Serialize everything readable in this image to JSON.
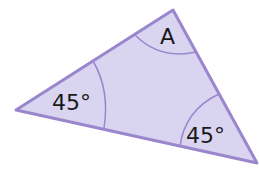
{
  "diagram": {
    "type": "triangle-angles",
    "fill_color": "#d9d4f0",
    "stroke_color": "#9a86cc",
    "vertices": {
      "top": [
        173,
        10
      ],
      "left": [
        16,
        110
      ],
      "bottom_right": [
        257,
        163
      ]
    },
    "angles": [
      {
        "vertex": "top",
        "label": "A"
      },
      {
        "vertex": "left",
        "label": "45°"
      },
      {
        "vertex": "bottom_right",
        "label": "45°"
      }
    ]
  }
}
